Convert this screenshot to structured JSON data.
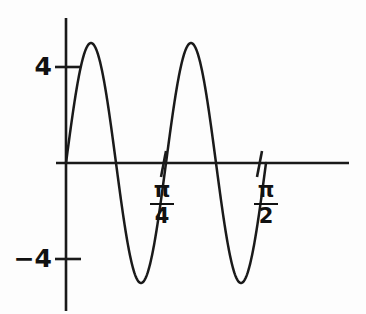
{
  "chart_data": {
    "type": "line",
    "title": "",
    "xlabel": "",
    "ylabel": "",
    "amplitude": 5,
    "period": 0.7853981634,
    "function": "y = 5 sin(8x)",
    "xlim": [
      0,
      1.0799
    ],
    "ylim": [
      -6.3,
      6.3
    ],
    "grid": false,
    "legend": null,
    "x_ticks": [
      {
        "value": 0.7853981634,
        "numerator": "π",
        "denominator": "4"
      },
      {
        "value": 1.5707963268,
        "numerator": "π",
        "denominator": "2"
      }
    ],
    "y_ticks": [
      {
        "value": 4,
        "label": "4"
      },
      {
        "value": -4,
        "label": "−4"
      }
    ],
    "series": [
      {
        "name": "sine",
        "color": "#1a1a1a",
        "x_start": 0,
        "x_end": 1.5707963268,
        "points": [
          {
            "x": 0,
            "y": 0
          },
          {
            "x": 0.0982,
            "y": 5
          },
          {
            "x": 0.1963,
            "y": 0
          },
          {
            "x": 0.2945,
            "y": -5
          },
          {
            "x": 0.3927,
            "y": 0
          },
          {
            "x": 0.4909,
            "y": 5
          },
          {
            "x": 0.589,
            "y": 0
          },
          {
            "x": 0.6872,
            "y": -5
          },
          {
            "x": 0.7854,
            "y": 0
          }
        ]
      }
    ],
    "annotations": [],
    "colors": {
      "curve": "#1a1a1a",
      "axis": "#1a1a1a",
      "background": "#fdfdfd",
      "text": "#111111"
    }
  },
  "axes": {
    "x_axis_name": "horizontal-axis",
    "y_axis_name": "vertical-axis"
  }
}
